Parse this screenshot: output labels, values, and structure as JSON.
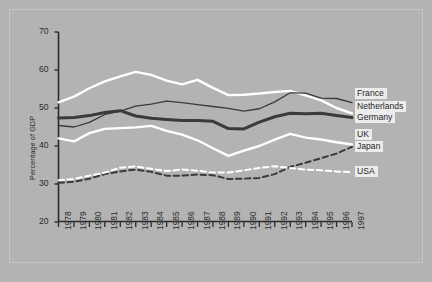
{
  "chart_data": {
    "type": "line",
    "title": "",
    "subtitle": "",
    "xlabel": "",
    "ylabel": "Percentage of GDP",
    "xlim": [
      1978,
      1997
    ],
    "ylim": [
      20,
      70
    ],
    "ytick_step": 10,
    "grid": false,
    "legend_position": "right",
    "background_color": "#b3b3b3",
    "categories": [
      "1978",
      "1979",
      "1980",
      "1981",
      "1982",
      "1983",
      "1984",
      "1985",
      "1986",
      "1987",
      "1988",
      "1989",
      "1990",
      "1991",
      "1992",
      "1993",
      "1994",
      "1995",
      "1996",
      "1997"
    ],
    "yticks": [
      "70",
      "60",
      "50",
      "40",
      "30",
      "20"
    ],
    "series": [
      {
        "name": "France",
        "color": "#ffffff",
        "style": "solid",
        "width": 2.4,
        "values": [
          51.5,
          53.0,
          55.2,
          57.0,
          58.3,
          59.5,
          58.7,
          57.2,
          56.2,
          57.4,
          55.3,
          53.4,
          53.5,
          53.8,
          54.2,
          54.5,
          53.3,
          52.0,
          50.0,
          48.6
        ]
      },
      {
        "name": "Netherlands",
        "color": "#3a3a3a",
        "style": "solid",
        "width": 1.3,
        "values": [
          45.4,
          45.0,
          46.2,
          48.3,
          49.2,
          50.5,
          51.0,
          51.8,
          51.4,
          50.9,
          50.4,
          49.9,
          49.2,
          49.8,
          51.6,
          54.0,
          53.9,
          52.6,
          52.5,
          51.4
        ]
      },
      {
        "name": "Germany",
        "color": "#3a3a3a",
        "style": "solid",
        "width": 3.0,
        "values": [
          47.4,
          47.5,
          48.0,
          48.8,
          49.3,
          47.9,
          47.3,
          47.0,
          46.7,
          46.7,
          46.5,
          44.6,
          44.5,
          46.3,
          47.7,
          48.6,
          48.5,
          48.6,
          48.0,
          47.5
        ]
      },
      {
        "name": "UK",
        "color": "#ffffff",
        "style": "solid",
        "width": 2.4,
        "values": [
          42.0,
          41.2,
          43.4,
          44.5,
          44.7,
          44.9,
          45.3,
          44.0,
          43.0,
          41.5,
          39.4,
          37.4,
          38.8,
          40.0,
          41.7,
          43.2,
          42.2,
          41.7,
          41.0,
          40.4
        ]
      },
      {
        "name": "Japan",
        "color": "#3a3a3a",
        "style": "dashed",
        "width": 2.0,
        "values": [
          30.3,
          30.6,
          31.4,
          32.6,
          33.3,
          33.8,
          33.2,
          32.2,
          32.2,
          32.5,
          32.3,
          31.3,
          31.4,
          31.6,
          32.6,
          34.5,
          35.6,
          36.8,
          38.0,
          39.8
        ]
      },
      {
        "name": "USA",
        "color": "#ffffff",
        "style": "dashed",
        "width": 2.0,
        "values": [
          31.0,
          31.3,
          32.2,
          33.0,
          34.3,
          34.6,
          34.0,
          33.4,
          33.8,
          33.5,
          33.0,
          33.0,
          33.6,
          34.2,
          34.7,
          34.2,
          33.8,
          33.6,
          33.3,
          33.1
        ]
      }
    ],
    "legend": [
      {
        "label": "France"
      },
      {
        "label": "Netherlands"
      },
      {
        "label": "Germany"
      },
      {
        "label": "UK"
      },
      {
        "label": "Japan"
      },
      {
        "label": "USA"
      }
    ]
  }
}
